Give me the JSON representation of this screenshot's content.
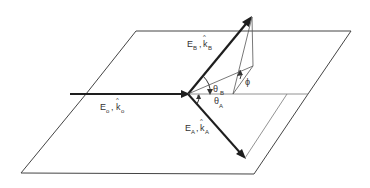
{
  "diagram": {
    "labels": {
      "incident": {
        "field": "E",
        "field_sub": "o",
        "sep": ",",
        "vector": "k",
        "vector_sub": "o"
      },
      "wave_b": {
        "field": "E",
        "field_sub": "B",
        "sep": ",",
        "vector": "k",
        "vector_sub": "B"
      },
      "wave_a": {
        "field": "E",
        "field_sub": "A",
        "sep": ",",
        "vector": "k",
        "vector_sub": "A"
      },
      "theta_b": {
        "symbol": "θ",
        "sub": "B"
      },
      "theta_a": {
        "symbol": "θ",
        "sub": "A"
      },
      "phi": {
        "symbol": "ϕ"
      }
    },
    "colors": {
      "line": "#2a2a2a",
      "thin": "#555555",
      "text": "#333333"
    }
  }
}
